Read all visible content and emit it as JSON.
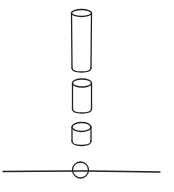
{
  "diagram": {
    "stroke_color": "#222222",
    "background": "#ffffff",
    "shapes": [
      {
        "type": "cylinder",
        "name": "tall-cylinder",
        "cx": 81.5,
        "top": 12,
        "bottom": 70,
        "rx": 10,
        "ry": 3.5
      },
      {
        "type": "cylinder",
        "name": "medium-cylinder",
        "cx": 82,
        "top": 82,
        "bottom": 110,
        "rx": 9.5,
        "ry": 4
      },
      {
        "type": "cylinder",
        "name": "short-cylinder",
        "cx": 81.5,
        "top": 125,
        "bottom": 143,
        "rx": 9.5,
        "ry": 4.5
      },
      {
        "type": "circle",
        "name": "base-circle",
        "cx": 80.5,
        "cy": 170,
        "r": 8
      },
      {
        "type": "line",
        "name": "ground-line",
        "x1": 3,
        "y1": 171,
        "x2": 160,
        "y2": 171.5
      }
    ]
  }
}
